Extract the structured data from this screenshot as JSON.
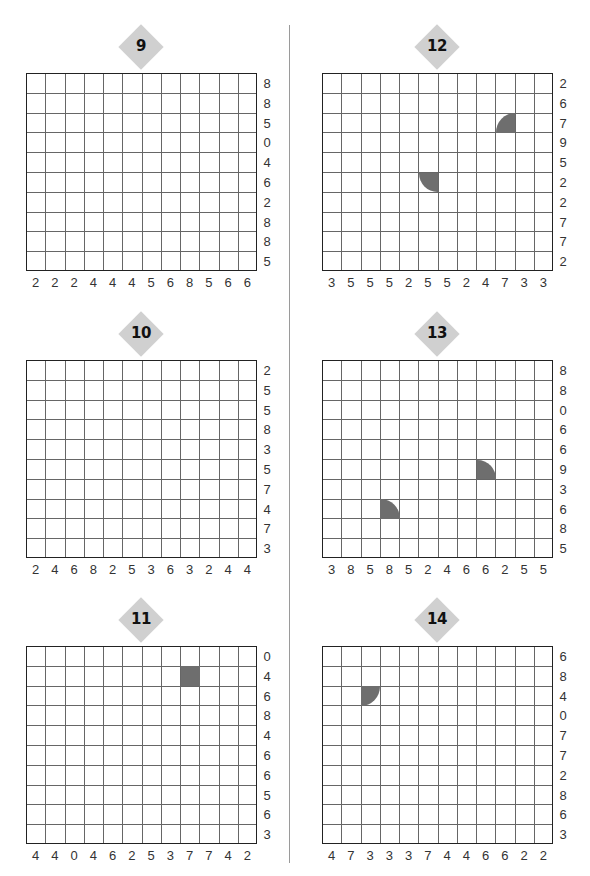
{
  "puzzles": [
    {
      "id": "9",
      "label": "9",
      "position": "left",
      "row_clues": [
        "8",
        "8",
        "5",
        "0",
        "4",
        "6",
        "2",
        "8",
        "8",
        "5"
      ],
      "col_clues": [
        "2",
        "2",
        "2",
        "4",
        "4",
        "4",
        "5",
        "6",
        "8",
        "5",
        "6",
        "6"
      ],
      "given_shapes": []
    },
    {
      "id": "10",
      "label": "10",
      "position": "left",
      "row_clues": [
        "2",
        "5",
        "5",
        "8",
        "3",
        "5",
        "7",
        "4",
        "7",
        "3"
      ],
      "col_clues": [
        "2",
        "4",
        "6",
        "8",
        "2",
        "5",
        "3",
        "6",
        "3",
        "2",
        "4",
        "4"
      ],
      "given_shapes": []
    },
    {
      "id": "11",
      "label": "11",
      "position": "left",
      "row_clues": [
        "0",
        "4",
        "6",
        "8",
        "4",
        "6",
        "6",
        "5",
        "6",
        "3"
      ],
      "col_clues": [
        "4",
        "4",
        "0",
        "4",
        "6",
        "2",
        "5",
        "3",
        "7",
        "7",
        "4",
        "2"
      ],
      "given_shapes": [
        {
          "row": 1,
          "col": 8,
          "shape": "square"
        }
      ]
    },
    {
      "id": "12",
      "label": "12",
      "position": "right",
      "row_clues": [
        "2",
        "6",
        "7",
        "9",
        "5",
        "2",
        "2",
        "7",
        "7",
        "2"
      ],
      "col_clues": [
        "3",
        "5",
        "5",
        "5",
        "2",
        "5",
        "5",
        "2",
        "4",
        "7",
        "3",
        "3"
      ],
      "given_shapes": [
        {
          "row": 2,
          "col": 9,
          "shape": "quarter-round-top-left"
        },
        {
          "row": 5,
          "col": 5,
          "shape": "quarter-round-bottom-left"
        }
      ]
    },
    {
      "id": "13",
      "label": "13",
      "position": "right",
      "row_clues": [
        "8",
        "8",
        "0",
        "6",
        "6",
        "9",
        "3",
        "6",
        "8",
        "5"
      ],
      "col_clues": [
        "3",
        "8",
        "5",
        "8",
        "5",
        "2",
        "4",
        "6",
        "6",
        "2",
        "5",
        "5"
      ],
      "given_shapes": [
        {
          "row": 5,
          "col": 8,
          "shape": "quarter-round-top-right"
        },
        {
          "row": 7,
          "col": 3,
          "shape": "quarter-round-top-right"
        }
      ]
    },
    {
      "id": "14",
      "label": "14",
      "position": "right",
      "row_clues": [
        "6",
        "8",
        "4",
        "0",
        "7",
        "7",
        "2",
        "8",
        "6",
        "3"
      ],
      "col_clues": [
        "4",
        "7",
        "3",
        "3",
        "3",
        "7",
        "4",
        "4",
        "6",
        "6",
        "2",
        "2"
      ],
      "given_shapes": [
        {
          "row": 2,
          "col": 2,
          "shape": "quarter-round-bottom-right"
        }
      ]
    }
  ],
  "colors": {
    "badge": "#d0d0d0",
    "filled_shape": "#6e6e6e",
    "grid_border": "#222222",
    "grid_line": "#666666",
    "divider": "#9a9a9a"
  }
}
